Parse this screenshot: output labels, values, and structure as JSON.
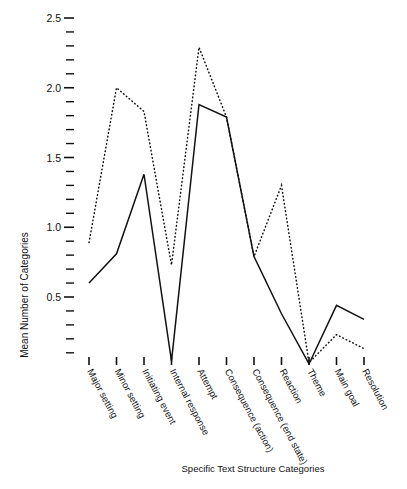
{
  "chart_data": {
    "type": "line",
    "title": "",
    "xlabel": "Specific Text Structure Categories",
    "ylabel": "Mean Number of Categories",
    "categories": [
      "Major setting",
      "Minor setting",
      "Initiating event",
      "Internal response",
      "Attempt",
      "Consequence (action)",
      "Consequence (end state)",
      "Reaction",
      "Theme",
      "Main goal",
      "Resolution"
    ],
    "series": [
      {
        "name": "solid",
        "style": "solid",
        "values": [
          0.6,
          0.81,
          1.38,
          0.04,
          1.88,
          1.79,
          0.79,
          0.38,
          0.02,
          0.44,
          0.34
        ]
      },
      {
        "name": "dotted",
        "style": "dotted",
        "values": [
          0.89,
          2.0,
          1.83,
          0.73,
          2.29,
          1.79,
          0.79,
          1.3,
          0.03,
          0.23,
          0.13
        ]
      }
    ],
    "ylim": [
      0.0,
      2.5
    ],
    "ytick_labels": [
      "2.5",
      "2.0",
      "1.5",
      "1.0",
      "0.5"
    ],
    "ytick_values": [
      2.5,
      2.0,
      1.5,
      1.0,
      0.5
    ],
    "minor_tick_step": 0.1,
    "grid": false,
    "legend": "none"
  }
}
